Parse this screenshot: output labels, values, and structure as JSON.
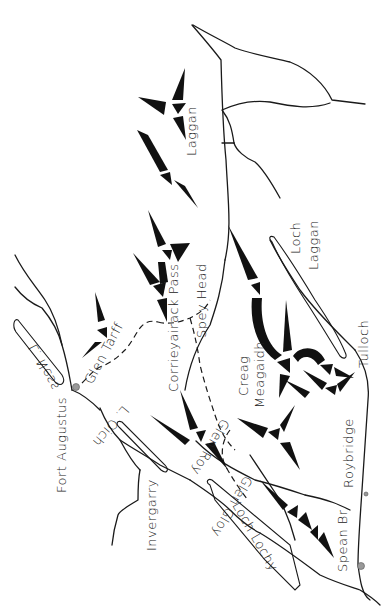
{
  "map": {
    "title": "Creag Meagaidh and Corrieyairack region sketch map",
    "orientation": "rotated 90 degrees (north to the left)",
    "labels": {
      "laggan": "Laggan",
      "loch_laggan_1": "Loch",
      "loch_laggan_2": "Laggan",
      "tulloch": "Tulloch",
      "spey_head": "Spey Head",
      "creag_1": "Creag",
      "creag_2": "Meagaidh",
      "corrieyairack_1": "Corrieyairack Pass",
      "glen_tarff": "Glen Tarff",
      "l_ness": "L. Ness",
      "fort_augustus": "Fort Augustus",
      "l_oich": "L. Oich",
      "invergarry": "Invergarry",
      "glen_roy": "Glen Roy",
      "glen_gloy": "Glen Gloy",
      "roybridge": "Roybridge",
      "spean_br": "Spean Br.",
      "loch_lochy": "Loch Lochy"
    },
    "features": {
      "ridges": "black tapered ridge symbols",
      "roads": "solid lines",
      "tracks": "dashed lines",
      "lochs": "outlined elongated shapes",
      "towns": "grey dot markers"
    },
    "colors": {
      "ink": "#111111",
      "paper": "#ffffff",
      "town_marker": "#999999"
    }
  }
}
